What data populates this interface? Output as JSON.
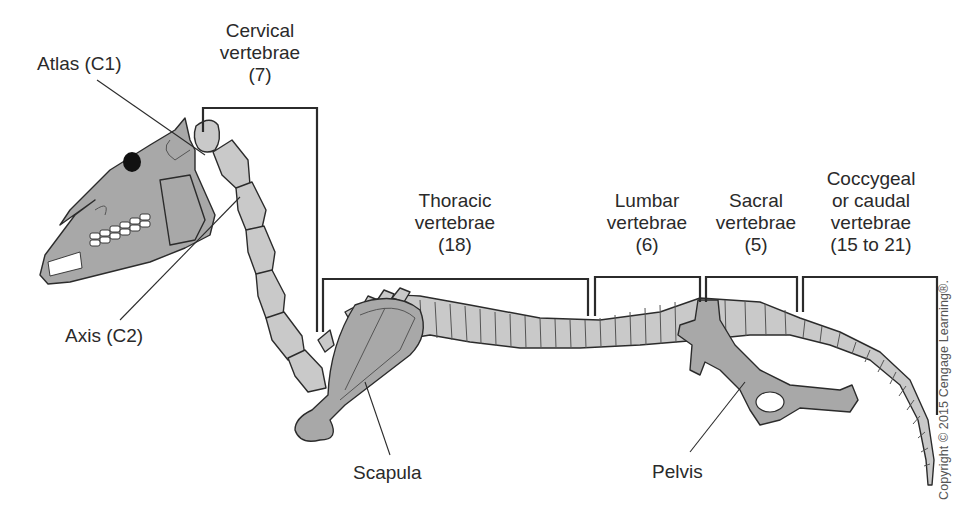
{
  "figure": {
    "colors": {
      "bone_fill": "#c9c9c9",
      "bone_fill_dark": "#a9a9a9",
      "outline": "#2b2b2b",
      "bracket": "#2b2b2b",
      "text": "#2a2a2a"
    }
  },
  "labels": {
    "atlas": "Atlas (C1)",
    "axis": "Axis (C2)",
    "scapula": "Scapula",
    "pelvis": "Pelvis"
  },
  "regions": [
    {
      "id": "cervical",
      "lines": [
        "Cervical",
        "vertebrae",
        "(7)"
      ]
    },
    {
      "id": "thoracic",
      "lines": [
        "Thoracic",
        "vertebrae",
        "(18)"
      ]
    },
    {
      "id": "lumbar",
      "lines": [
        "Lumbar",
        "vertebrae",
        "(6)"
      ]
    },
    {
      "id": "sacral",
      "lines": [
        "Sacral",
        "vertebrae",
        "(5)"
      ]
    },
    {
      "id": "coccygeal",
      "lines": [
        "Coccygeal",
        "or caudal",
        "vertebrae",
        "(15 to 21)"
      ]
    }
  ],
  "copyright": "Copyright © 2015 Cengage Learning®."
}
